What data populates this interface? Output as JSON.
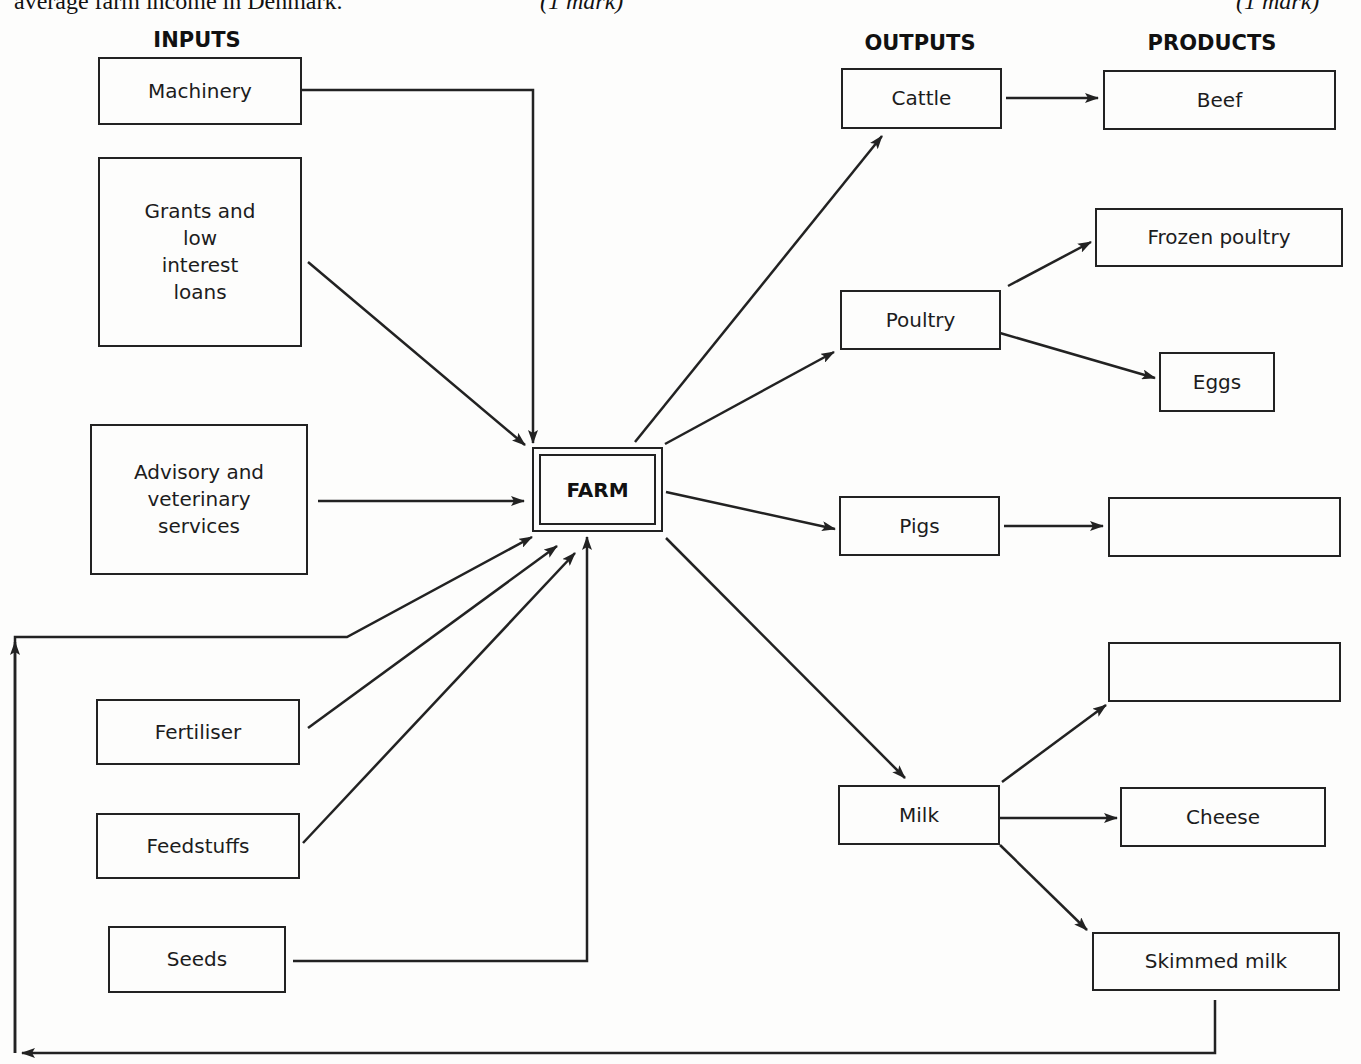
{
  "header_fragment": {
    "left_text": "average farm income in Denmark.",
    "mark_left": "(1 mark)",
    "mark_right": "(1 mark)"
  },
  "columns": {
    "inputs": "INPUTS",
    "outputs": "OUTPUTS",
    "products": "PRODUCTS"
  },
  "center": {
    "label": "FARM"
  },
  "inputs": [
    {
      "id": "machinery",
      "label": "Machinery"
    },
    {
      "id": "grants",
      "label": "Grants and\nlow\ninterest\nloans"
    },
    {
      "id": "advisory",
      "label": "Advisory and\nveterinary\nservices"
    },
    {
      "id": "fertiliser",
      "label": "Fertiliser"
    },
    {
      "id": "feedstuffs",
      "label": "Feedstuffs"
    },
    {
      "id": "seeds",
      "label": "Seeds"
    }
  ],
  "outputs": [
    {
      "id": "cattle",
      "label": "Cattle"
    },
    {
      "id": "poultry",
      "label": "Poultry"
    },
    {
      "id": "pigs",
      "label": "Pigs"
    },
    {
      "id": "milk",
      "label": "Milk"
    }
  ],
  "products": [
    {
      "id": "beef",
      "label": "Beef",
      "from": "cattle"
    },
    {
      "id": "frozen-poultry",
      "label": "Frozen poultry",
      "from": "poultry"
    },
    {
      "id": "eggs",
      "label": "Eggs",
      "from": "poultry"
    },
    {
      "id": "pigs-product-blank",
      "label": "",
      "from": "pigs"
    },
    {
      "id": "milk-product-blank",
      "label": "",
      "from": "milk"
    },
    {
      "id": "cheese",
      "label": "Cheese",
      "from": "milk"
    },
    {
      "id": "skimmed-milk",
      "label": "Skimmed milk",
      "from": "milk"
    }
  ],
  "feedback_loop": {
    "from": "skimmed-milk",
    "to": "farm",
    "description": "Skimmed milk returned to farm as input"
  },
  "colors": {
    "line": "#222222",
    "background": "#fdfdfc",
    "text": "#1a1a1a"
  }
}
